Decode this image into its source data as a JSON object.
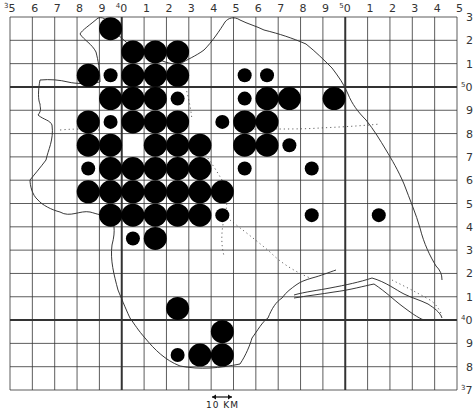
{
  "map": {
    "type": "grid distribution map",
    "grid": {
      "columns": 20,
      "rows": 16,
      "left": 10,
      "top": 17,
      "right": 457,
      "bottom": 390,
      "major_vertical_columns": [
        5,
        15
      ],
      "major_horizontal_rows": [
        3,
        13
      ]
    },
    "top_labels": [
      {
        "sup": "3",
        "text": "5"
      },
      {
        "sup": "",
        "text": "6"
      },
      {
        "sup": "",
        "text": "7"
      },
      {
        "sup": "",
        "text": "8"
      },
      {
        "sup": "",
        "text": "9"
      },
      {
        "sup": "4",
        "text": "0"
      },
      {
        "sup": "",
        "text": "1"
      },
      {
        "sup": "",
        "text": "2"
      },
      {
        "sup": "",
        "text": "3"
      },
      {
        "sup": "",
        "text": "4"
      },
      {
        "sup": "",
        "text": "5"
      },
      {
        "sup": "",
        "text": "6"
      },
      {
        "sup": "",
        "text": "7"
      },
      {
        "sup": "",
        "text": "8"
      },
      {
        "sup": "",
        "text": "9"
      },
      {
        "sup": "5",
        "text": "0"
      },
      {
        "sup": "",
        "text": "1"
      },
      {
        "sup": "",
        "text": "2"
      },
      {
        "sup": "",
        "text": "3"
      },
      {
        "sup": "",
        "text": "4"
      },
      {
        "sup": "",
        "text": "5"
      }
    ],
    "right_labels": [
      {
        "sup": "",
        "text": "3"
      },
      {
        "sup": "",
        "text": "2"
      },
      {
        "sup": "",
        "text": "1"
      },
      {
        "sup": "5",
        "text": "0"
      },
      {
        "sup": "",
        "text": "9"
      },
      {
        "sup": "",
        "text": "8"
      },
      {
        "sup": "",
        "text": "7"
      },
      {
        "sup": "",
        "text": "6"
      },
      {
        "sup": "",
        "text": "5"
      },
      {
        "sup": "",
        "text": "4"
      },
      {
        "sup": "",
        "text": "3"
      },
      {
        "sup": "",
        "text": "2"
      },
      {
        "sup": "",
        "text": "1"
      },
      {
        "sup": "4",
        "text": "0"
      },
      {
        "sup": "",
        "text": "9"
      },
      {
        "sup": "",
        "text": "8"
      },
      {
        "sup": "3",
        "text": "7"
      }
    ],
    "scale_bar": {
      "label": "10 KM"
    },
    "dot_sizes": {
      "large": 11.5,
      "small": 7
    },
    "dots": [
      {
        "c": 4,
        "r": 0,
        "s": "large"
      },
      {
        "c": 5,
        "r": 1,
        "s": "large"
      },
      {
        "c": 6,
        "r": 1,
        "s": "large"
      },
      {
        "c": 7,
        "r": 1,
        "s": "large"
      },
      {
        "c": 3,
        "r": 2,
        "s": "large"
      },
      {
        "c": 4,
        "r": 2,
        "s": "small"
      },
      {
        "c": 5,
        "r": 2,
        "s": "large"
      },
      {
        "c": 6,
        "r": 2,
        "s": "large"
      },
      {
        "c": 7,
        "r": 2,
        "s": "large"
      },
      {
        "c": 10,
        "r": 2,
        "s": "small"
      },
      {
        "c": 11,
        "r": 2,
        "s": "small"
      },
      {
        "c": 4,
        "r": 3,
        "s": "large"
      },
      {
        "c": 5,
        "r": 3,
        "s": "large"
      },
      {
        "c": 6,
        "r": 3,
        "s": "large"
      },
      {
        "c": 7,
        "r": 3,
        "s": "small"
      },
      {
        "c": 10,
        "r": 3,
        "s": "small"
      },
      {
        "c": 11,
        "r": 3,
        "s": "large"
      },
      {
        "c": 12,
        "r": 3,
        "s": "large"
      },
      {
        "c": 14,
        "r": 3,
        "s": "large"
      },
      {
        "c": 3,
        "r": 4,
        "s": "large"
      },
      {
        "c": 4,
        "r": 4,
        "s": "small"
      },
      {
        "c": 5,
        "r": 4,
        "s": "large"
      },
      {
        "c": 6,
        "r": 4,
        "s": "large"
      },
      {
        "c": 7,
        "r": 4,
        "s": "large"
      },
      {
        "c": 9,
        "r": 4,
        "s": "small"
      },
      {
        "c": 10,
        "r": 4,
        "s": "large"
      },
      {
        "c": 11,
        "r": 4,
        "s": "large"
      },
      {
        "c": 3,
        "r": 5,
        "s": "large"
      },
      {
        "c": 4,
        "r": 5,
        "s": "large"
      },
      {
        "c": 6,
        "r": 5,
        "s": "large"
      },
      {
        "c": 7,
        "r": 5,
        "s": "large"
      },
      {
        "c": 8,
        "r": 5,
        "s": "large"
      },
      {
        "c": 10,
        "r": 5,
        "s": "large"
      },
      {
        "c": 11,
        "r": 5,
        "s": "large"
      },
      {
        "c": 12,
        "r": 5,
        "s": "small"
      },
      {
        "c": 3,
        "r": 6,
        "s": "small"
      },
      {
        "c": 4,
        "r": 6,
        "s": "large"
      },
      {
        "c": 5,
        "r": 6,
        "s": "large"
      },
      {
        "c": 6,
        "r": 6,
        "s": "large"
      },
      {
        "c": 7,
        "r": 6,
        "s": "large"
      },
      {
        "c": 8,
        "r": 6,
        "s": "large"
      },
      {
        "c": 10,
        "r": 6,
        "s": "small"
      },
      {
        "c": 13,
        "r": 6,
        "s": "small"
      },
      {
        "c": 3,
        "r": 7,
        "s": "large"
      },
      {
        "c": 4,
        "r": 7,
        "s": "large"
      },
      {
        "c": 5,
        "r": 7,
        "s": "large"
      },
      {
        "c": 6,
        "r": 7,
        "s": "large"
      },
      {
        "c": 7,
        "r": 7,
        "s": "large"
      },
      {
        "c": 8,
        "r": 7,
        "s": "large"
      },
      {
        "c": 9,
        "r": 7,
        "s": "large"
      },
      {
        "c": 4,
        "r": 8,
        "s": "large"
      },
      {
        "c": 5,
        "r": 8,
        "s": "large"
      },
      {
        "c": 6,
        "r": 8,
        "s": "large"
      },
      {
        "c": 7,
        "r": 8,
        "s": "large"
      },
      {
        "c": 8,
        "r": 8,
        "s": "large"
      },
      {
        "c": 9,
        "r": 8,
        "s": "small"
      },
      {
        "c": 13,
        "r": 8,
        "s": "small"
      },
      {
        "c": 16,
        "r": 8,
        "s": "small"
      },
      {
        "c": 5,
        "r": 9,
        "s": "small"
      },
      {
        "c": 6,
        "r": 9,
        "s": "large"
      },
      {
        "c": 7,
        "r": 12,
        "s": "large"
      },
      {
        "c": 9,
        "r": 13,
        "s": "large"
      },
      {
        "c": 7,
        "r": 14,
        "s": "small"
      },
      {
        "c": 8,
        "r": 14,
        "s": "large"
      },
      {
        "c": 9,
        "r": 14,
        "s": "large"
      }
    ],
    "colors": {
      "grid": "#333333",
      "dot": "#000000",
      "outline": "#222222",
      "boundary_dotted": "#555555"
    }
  }
}
